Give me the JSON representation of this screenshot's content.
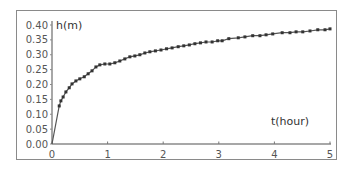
{
  "chart_data": {
    "type": "line",
    "title": "",
    "xlabel": "t(hour)",
    "ylabel": "h(m)",
    "xlim": [
      0,
      5
    ],
    "ylim": [
      0,
      0.4
    ],
    "grid": false,
    "legend": null,
    "x_ticks": [
      "0",
      "1",
      "2",
      "3",
      "4",
      "5"
    ],
    "y_ticks": [
      "0.00",
      "0.05",
      "0.10",
      "0.15",
      "0.20",
      "0.25",
      "0.30",
      "0.35",
      "0.40"
    ],
    "series": [
      {
        "name": "h(t)",
        "marker": "square",
        "color": "#444444",
        "x": [
          0.0,
          0.13,
          0.16,
          0.2,
          0.25,
          0.31,
          0.36,
          0.43,
          0.5,
          0.58,
          0.65,
          0.72,
          0.79,
          0.86,
          0.95,
          1.04,
          1.13,
          1.22,
          1.31,
          1.4,
          1.49,
          1.58,
          1.67,
          1.76,
          1.86,
          1.96,
          2.06,
          2.16,
          2.27,
          2.37,
          2.47,
          2.57,
          2.67,
          2.77,
          2.88,
          2.98,
          3.06,
          3.18,
          3.35,
          3.47,
          3.61,
          3.74,
          3.85,
          3.97,
          4.14,
          4.28,
          4.39,
          4.51,
          4.64,
          4.78,
          4.91,
          5.0
        ],
        "y": [
          0.0,
          0.128,
          0.145,
          0.158,
          0.175,
          0.189,
          0.202,
          0.212,
          0.219,
          0.226,
          0.236,
          0.246,
          0.259,
          0.266,
          0.269,
          0.269,
          0.273,
          0.279,
          0.286,
          0.293,
          0.296,
          0.3,
          0.306,
          0.31,
          0.313,
          0.316,
          0.32,
          0.323,
          0.327,
          0.33,
          0.333,
          0.337,
          0.34,
          0.343,
          0.343,
          0.347,
          0.347,
          0.354,
          0.357,
          0.36,
          0.364,
          0.364,
          0.367,
          0.37,
          0.374,
          0.374,
          0.377,
          0.377,
          0.38,
          0.384,
          0.384,
          0.387
        ]
      }
    ]
  }
}
